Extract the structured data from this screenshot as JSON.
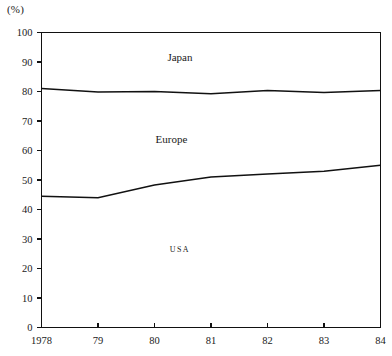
{
  "chart_data": {
    "type": "area",
    "title": "",
    "subtitle": "",
    "xlabel": "",
    "ylabel": "(%)",
    "unit_label": "(%)",
    "grid": false,
    "legend_position": "inline-labels",
    "x": [
      1978,
      1979,
      1980,
      1981,
      1982,
      1983,
      1984
    ],
    "categories": [
      "1978",
      "79",
      "80",
      "81",
      "82",
      "83",
      "84"
    ],
    "xtick_labels": [
      "1978",
      "79",
      "80",
      "81",
      "82",
      "83",
      "84"
    ],
    "ytick_labels": [
      "0",
      "10",
      "20",
      "30",
      "40",
      "50",
      "60",
      "70",
      "80",
      "90",
      "100"
    ],
    "ytick_values": [
      0,
      10,
      20,
      30,
      40,
      50,
      60,
      70,
      80,
      90,
      100
    ],
    "ylim": [
      0,
      100
    ],
    "xlim": [
      1978,
      1984
    ],
    "stacked": true,
    "series": [
      {
        "name": "USA",
        "label": "USA",
        "values": [
          44.5,
          44.0,
          48.3,
          51.0,
          52.0,
          53.0,
          55.0
        ],
        "cumulative_top": [
          44.5,
          44.0,
          48.3,
          51.0,
          52.0,
          53.0,
          55.0
        ]
      },
      {
        "name": "Europe",
        "label": "Europe",
        "values": [
          36.5,
          35.8,
          31.7,
          28.2,
          28.3,
          26.7,
          25.3
        ],
        "cumulative_top": [
          81.0,
          79.8,
          80.0,
          79.2,
          80.3,
          79.7,
          80.3
        ]
      },
      {
        "name": "Japan",
        "label": "Japan",
        "values": [
          19.0,
          20.2,
          20.0,
          20.8,
          19.7,
          20.3,
          19.7
        ],
        "cumulative_top": [
          100,
          100,
          100,
          100,
          100,
          100,
          100
        ]
      }
    ],
    "inline_labels": [
      {
        "text": "Japan",
        "x_value": 1980.45,
        "y_value": 90.5,
        "style": "normal"
      },
      {
        "text": "Europe",
        "x_value": 1980.3,
        "y_value": 62.5,
        "style": "normal"
      },
      {
        "text": "USA",
        "x_value": 1980.45,
        "y_value": 25.5,
        "style": "small-caps"
      }
    ],
    "colors": {
      "line": "#111111",
      "text": "#1a1a1a",
      "background": "#ffffff"
    }
  }
}
